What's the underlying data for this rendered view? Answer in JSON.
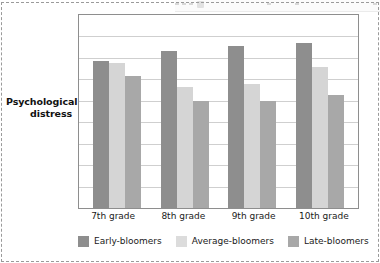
{
  "figure": {
    "y_axis_title_line1": "Psychological",
    "y_axis_title_line2": "distress"
  },
  "top_strip": {
    "visible": true,
    "description": "partial-ui-toolbar-sliver"
  },
  "colors": {
    "early": "#8e8e8e",
    "average": "#d5d5d5",
    "late": "#a8a8a8",
    "gridline": "#cfcfcf",
    "frame": "#8e8e8e",
    "text": "#1a1a1a",
    "background": "#ffffff",
    "crop_border": "#9a9a9a"
  },
  "chart_data": {
    "type": "bar",
    "title": "",
    "subtitle": "",
    "xlabel": "",
    "ylabel": "Psychological distress",
    "categories": [
      "7th grade",
      "8th grade",
      "9th grade",
      "10th grade"
    ],
    "series": [
      {
        "name": "Early-bloomers",
        "color": "#8e8e8e",
        "values": [
          0.76,
          0.815,
          0.84,
          0.855
        ]
      },
      {
        "name": "Average-bloomers",
        "color": "#d5d5d5",
        "values": [
          0.75,
          0.625,
          0.645,
          0.732
        ]
      },
      {
        "name": "Late-bloomers",
        "color": "#a8a8a8",
        "values": [
          0.685,
          0.557,
          0.557,
          0.588
        ]
      }
    ],
    "ylim": [
      0,
      1
    ],
    "yticks_labeled": false,
    "gridlines": 8,
    "grid": true,
    "legend_position": "bottom",
    "annotations": []
  }
}
